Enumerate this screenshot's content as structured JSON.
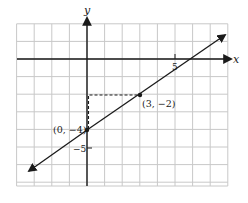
{
  "chart_data": {
    "type": "line",
    "title": "",
    "xlabel": "x",
    "ylabel": "y",
    "xlim": [
      -4,
      8
    ],
    "ylim": [
      -7,
      2
    ],
    "grid": true,
    "grid_step": 1,
    "tick_labels": {
      "x": [
        {
          "value": 5,
          "label": "5"
        }
      ],
      "y": [
        {
          "value": -5,
          "label": "−5"
        }
      ]
    },
    "line": {
      "equation": "y = (2/3)x - 4",
      "slope": 0.6667,
      "intercept": -4,
      "arrows": "both"
    },
    "points": [
      {
        "x": 0,
        "y": -4,
        "label": "(0, −4)"
      },
      {
        "x": 3,
        "y": -2,
        "label": "(3, −2)"
      }
    ],
    "annotations": [
      {
        "type": "dashed-rise-run",
        "from": [
          0,
          -4
        ],
        "corner": [
          0,
          -2
        ],
        "to": [
          3,
          -2
        ]
      }
    ],
    "colors": {
      "grid": "#c8c8c8",
      "axes": "#1a1a1a",
      "line": "#1a1a1a"
    }
  },
  "labels": {
    "x_axis": "x",
    "y_axis": "y",
    "tick_x5": "5",
    "tick_yneg5": "−5",
    "point_a": "(0, −4)",
    "point_b": "(3, −2)"
  }
}
